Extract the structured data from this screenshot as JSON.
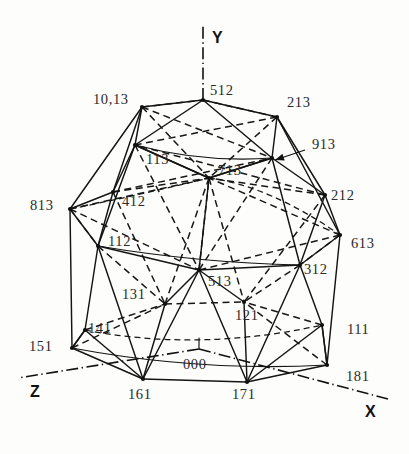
{
  "figure": {
    "background_color": "#fdfdfc",
    "line_color": "#141414",
    "label_color": "#2a2a2a"
  },
  "axes": [
    {
      "name": "Y",
      "label": "Y",
      "label_x": 212,
      "label_y": 39,
      "x1": 203,
      "y1": 100,
      "x2": 203,
      "y2": 26
    },
    {
      "name": "Z",
      "label": "Z",
      "label_x": 30,
      "label_y": 393,
      "x1": 199,
      "y1": 349,
      "x2": 18,
      "y2": 378
    },
    {
      "name": "X",
      "label": "X",
      "label_x": 365,
      "label_y": 413,
      "x1": 199,
      "y1": 349,
      "x2": 388,
      "y2": 399
    }
  ],
  "axis_origin": {
    "label": "000",
    "x": 199,
    "y": 349,
    "label_x": 183,
    "label_y": 366
  },
  "vertices": [
    {
      "id": "512",
      "label": "512",
      "x": 203,
      "y": 100,
      "label_x": 210,
      "label_y": 92,
      "dot": true
    },
    {
      "id": "1013",
      "label": "10,13",
      "x": 142,
      "y": 107,
      "label_x": 93,
      "label_y": 101,
      "dot": true
    },
    {
      "id": "213",
      "label": "213",
      "x": 277,
      "y": 117,
      "label_x": 287,
      "label_y": 104,
      "dot": true
    },
    {
      "id": "113",
      "label": "113",
      "x": 135,
      "y": 145,
      "label_x": 146,
      "label_y": 161,
      "dot": true
    },
    {
      "id": "913",
      "label": "913",
      "x": 272,
      "y": 158,
      "label_x": 312,
      "label_y": 146,
      "dot": true
    },
    {
      "id": "713",
      "label": "713",
      "x": 209,
      "y": 178,
      "label_x": 218,
      "label_y": 172,
      "dot": true
    },
    {
      "id": "412",
      "label": "412",
      "x": 113,
      "y": 192,
      "label_x": 122,
      "label_y": 203,
      "dot": true
    },
    {
      "id": "813",
      "label": "813",
      "x": 70,
      "y": 209,
      "label_x": 30,
      "label_y": 207,
      "dot": true
    },
    {
      "id": "212",
      "label": "212",
      "x": 325,
      "y": 195,
      "label_x": 331,
      "label_y": 197,
      "dot": true
    },
    {
      "id": "613",
      "label": "613",
      "x": 340,
      "y": 235,
      "label_x": 351,
      "label_y": 245,
      "dot": true
    },
    {
      "id": "112",
      "label": "112",
      "x": 98,
      "y": 246,
      "label_x": 108,
      "label_y": 243,
      "dot": true
    },
    {
      "id": "312",
      "label": "312",
      "x": 300,
      "y": 265,
      "label_x": 304,
      "label_y": 271,
      "dot": true
    },
    {
      "id": "513",
      "label": "513",
      "x": 199,
      "y": 270,
      "label_x": 208,
      "label_y": 283,
      "dot": true
    },
    {
      "id": "131",
      "label": "131",
      "x": 165,
      "y": 304,
      "label_x": 122,
      "label_y": 296,
      "dot": true
    },
    {
      "id": "121",
      "label": "121",
      "x": 244,
      "y": 302,
      "label_x": 235,
      "label_y": 317,
      "dot": true
    },
    {
      "id": "141",
      "label": "141",
      "x": 85,
      "y": 330,
      "label_x": 88,
      "label_y": 330,
      "dot": true
    },
    {
      "id": "111",
      "label": "111",
      "x": 322,
      "y": 325,
      "label_x": 347,
      "label_y": 331,
      "dot": true
    },
    {
      "id": "151",
      "label": "151",
      "x": 72,
      "y": 348,
      "label_x": 29,
      "label_y": 348,
      "dot": true
    },
    {
      "id": "161",
      "label": "161",
      "x": 143,
      "y": 379,
      "label_x": 128,
      "label_y": 396,
      "dot": true
    },
    {
      "id": "171",
      "label": "171",
      "x": 247,
      "y": 382,
      "label_x": 232,
      "label_y": 396,
      "dot": true
    },
    {
      "id": "181",
      "label": "181",
      "x": 327,
      "y": 365,
      "label_x": 346,
      "label_y": 378,
      "dot": true
    }
  ],
  "leader": {
    "from_x": 305,
    "from_y": 150,
    "to_x": 275,
    "to_y": 160,
    "target": "913"
  },
  "solid_edges": [
    [
      203,
      100,
      142,
      107
    ],
    [
      203,
      100,
      277,
      117
    ],
    [
      142,
      107,
      135,
      145
    ],
    [
      277,
      117,
      272,
      158
    ],
    [
      203,
      100,
      135,
      145
    ],
    [
      203,
      100,
      272,
      158
    ],
    [
      142,
      107,
      70,
      209
    ],
    [
      142,
      107,
      113,
      192
    ],
    [
      277,
      117,
      325,
      195
    ],
    [
      277,
      117,
      340,
      235
    ],
    [
      135,
      145,
      113,
      192
    ],
    [
      272,
      158,
      325,
      195
    ],
    [
      135,
      145,
      209,
      178
    ],
    [
      272,
      158,
      209,
      178
    ],
    [
      113,
      192,
      70,
      209
    ],
    [
      325,
      195,
      340,
      235
    ],
    [
      70,
      209,
      98,
      246
    ],
    [
      340,
      235,
      300,
      265
    ],
    [
      113,
      192,
      98,
      246
    ],
    [
      325,
      195,
      300,
      265
    ],
    [
      98,
      246,
      199,
      270
    ],
    [
      300,
      265,
      199,
      270
    ],
    [
      135,
      145,
      98,
      246
    ],
    [
      272,
      158,
      300,
      265
    ],
    [
      209,
      178,
      199,
      270
    ],
    [
      70,
      209,
      72,
      348
    ],
    [
      340,
      235,
      327,
      365
    ],
    [
      98,
      246,
      85,
      330
    ],
    [
      300,
      265,
      322,
      325
    ],
    [
      98,
      246,
      143,
      379
    ],
    [
      300,
      265,
      247,
      382
    ],
    [
      85,
      330,
      72,
      348
    ],
    [
      322,
      325,
      327,
      365
    ],
    [
      85,
      330,
      143,
      379
    ],
    [
      322,
      325,
      247,
      382
    ],
    [
      72,
      348,
      143,
      379
    ],
    [
      327,
      365,
      247,
      382
    ],
    [
      143,
      379,
      247,
      382
    ],
    [
      199,
      270,
      143,
      379
    ],
    [
      199,
      270,
      247,
      382
    ],
    [
      199,
      270,
      165,
      304
    ],
    [
      199,
      270,
      244,
      302
    ],
    [
      165,
      304,
      143,
      379
    ],
    [
      244,
      302,
      247,
      382
    ],
    [
      72,
      348,
      85,
      330
    ],
    [
      327,
      365,
      322,
      325
    ],
    [
      209,
      178,
      135,
      145
    ],
    [
      209,
      178,
      272,
      158
    ]
  ],
  "hidden_edges": [
    [
      142,
      107,
      203,
      100
    ],
    [
      203,
      100,
      277,
      117
    ],
    [
      142,
      107,
      209,
      178
    ],
    [
      277,
      117,
      209,
      178
    ],
    [
      142,
      107,
      272,
      158
    ],
    [
      277,
      117,
      135,
      145
    ],
    [
      113,
      192,
      209,
      178
    ],
    [
      325,
      195,
      209,
      178
    ],
    [
      70,
      209,
      209,
      178
    ],
    [
      340,
      235,
      209,
      178
    ],
    [
      209,
      178,
      165,
      304
    ],
    [
      209,
      178,
      244,
      302
    ],
    [
      113,
      192,
      165,
      304
    ],
    [
      325,
      195,
      244,
      302
    ],
    [
      98,
      246,
      165,
      304
    ],
    [
      300,
      265,
      244,
      302
    ],
    [
      70,
      209,
      98,
      246
    ],
    [
      340,
      235,
      300,
      265
    ],
    [
      135,
      145,
      199,
      270
    ],
    [
      272,
      158,
      199,
      270
    ],
    [
      165,
      304,
      244,
      302
    ],
    [
      85,
      330,
      165,
      304
    ],
    [
      322,
      325,
      244,
      302
    ],
    [
      72,
      348,
      165,
      304
    ],
    [
      327,
      365,
      244,
      302
    ],
    [
      113,
      192,
      272,
      158
    ],
    [
      325,
      195,
      135,
      145
    ],
    [
      70,
      209,
      199,
      270
    ],
    [
      340,
      235,
      199,
      270
    ],
    [
      199,
      270,
      209,
      178
    ]
  ],
  "band_curves": [
    {
      "d": "M 70,209 Q 135,196 209,178",
      "style": "hidden"
    },
    {
      "d": "M 209,178 Q 270,186 340,235",
      "style": "hidden"
    },
    {
      "d": "M 98,246 Q 200,263 300,265",
      "style": "solid"
    },
    {
      "d": "M 72,348 Q 200,372 327,365",
      "style": "solid"
    },
    {
      "d": "M 85,330 Q 200,352 322,325",
      "style": "hidden"
    },
    {
      "d": "M 135,145 Q 203,163 272,158",
      "style": "solid"
    }
  ]
}
